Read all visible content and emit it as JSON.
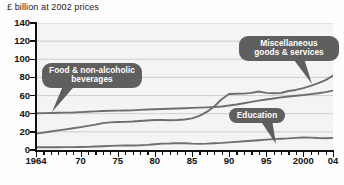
{
  "chart_data": {
    "type": "line",
    "title": "£ billion at 2002 prices",
    "xlabel": "",
    "ylabel": "",
    "ylim": [
      0,
      140
    ],
    "xlim": [
      1964,
      2004
    ],
    "yticks": [
      0,
      20,
      40,
      60,
      80,
      100,
      120,
      140
    ],
    "xticks": [
      1964,
      1970,
      1975,
      1980,
      1985,
      1990,
      1995,
      2000,
      2004
    ],
    "xtick_labels": [
      "1964",
      "70",
      "75",
      "80",
      "85",
      "90",
      "95",
      "2000",
      "04"
    ],
    "grid": true,
    "grid_axis": "y",
    "legend": "callout-labels",
    "x": [
      1964,
      1965,
      1966,
      1967,
      1968,
      1969,
      1970,
      1971,
      1972,
      1973,
      1974,
      1975,
      1976,
      1977,
      1978,
      1979,
      1980,
      1981,
      1982,
      1983,
      1984,
      1985,
      1986,
      1987,
      1988,
      1989,
      1990,
      1991,
      1992,
      1993,
      1994,
      1995,
      1996,
      1997,
      1998,
      1999,
      2000,
      2001,
      2002,
      2003,
      2004
    ],
    "series": [
      {
        "name": "Food & non-alcoholic beverages",
        "color": "#6e6e6e",
        "values": [
          40.5,
          40.6,
          40.8,
          41.0,
          41.2,
          41.4,
          41.8,
          42.2,
          42.6,
          43.0,
          43.2,
          43.4,
          43.5,
          43.7,
          44.2,
          44.6,
          45.0,
          45.2,
          45.4,
          45.7,
          46.0,
          46.4,
          46.7,
          47.0,
          47.4,
          48.0,
          49.0,
          50.2,
          51.6,
          53.0,
          54.4,
          55.6,
          56.8,
          58.0,
          59.0,
          59.8,
          60.6,
          61.6,
          62.6,
          63.8,
          65.5
        ]
      },
      {
        "name": "Miscellaneous goods & services",
        "color": "#6e6e6e",
        "values": [
          18.0,
          19.2,
          20.4,
          21.6,
          22.8,
          24.0,
          25.2,
          26.6,
          28.0,
          29.6,
          30.4,
          30.8,
          31.0,
          31.4,
          32.0,
          32.6,
          33.0,
          33.0,
          32.8,
          33.0,
          33.6,
          34.8,
          37.6,
          42.0,
          48.0,
          56.0,
          61.8,
          62.0,
          62.2,
          63.0,
          64.5,
          63.0,
          62.6,
          62.8,
          65.0,
          66.2,
          68.2,
          70.6,
          73.6,
          77.0,
          82.0
        ]
      },
      {
        "name": "Education",
        "color": "#6e6e6e",
        "values": [
          3.0,
          3.0,
          3.1,
          3.1,
          3.2,
          3.2,
          3.3,
          3.5,
          3.8,
          4.2,
          4.6,
          4.8,
          4.9,
          5.0,
          5.2,
          5.6,
          6.4,
          7.0,
          7.2,
          7.6,
          7.4,
          7.0,
          6.8,
          7.0,
          7.4,
          7.8,
          8.4,
          9.0,
          9.6,
          10.2,
          10.8,
          11.4,
          12.0,
          12.4,
          12.8,
          13.4,
          13.8,
          13.6,
          13.2,
          13.0,
          13.4
        ]
      }
    ],
    "annotations": [
      {
        "id": "food",
        "text": "Food & non-alcoholic\nbeverages",
        "points_to_year": 1967,
        "points_to_value": 41
      },
      {
        "id": "misc",
        "text": "Miscellaneous\ngoods & services",
        "points_to_year": 2002,
        "points_to_value": 74
      },
      {
        "id": "education",
        "text": "Education",
        "points_to_year": 1997,
        "points_to_value": 13
      }
    ]
  },
  "ui": {
    "bubble_color": "#5f5f5f",
    "bubble_text_color": "#ffffff",
    "plot_bg": "#f4f4f4",
    "axis_color": "#111111",
    "gridline_color": "#c9c9c9"
  }
}
